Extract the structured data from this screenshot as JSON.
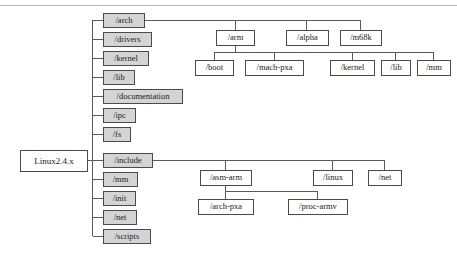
{
  "diagram": {
    "type": "tree",
    "colors": {
      "box_fill_highlight": "#d4d4d4",
      "box_fill_plain": "#ffffff",
      "box_stroke": "#4a4a4a",
      "edge_stroke": "#5a5a5a",
      "text": "#1a1a1a",
      "top_rule": "#b8b8b8",
      "background": "#ffffff"
    },
    "root": {
      "id": "root",
      "label": "Linux2.4.x",
      "filled": false,
      "x": 20,
      "y": 150,
      "w": 67,
      "h": 21
    },
    "level1": [
      {
        "id": "arch",
        "label": "/arch",
        "filled": true,
        "x": 103,
        "y": 13,
        "w": 41,
        "h": 14
      },
      {
        "id": "drivers",
        "label": "/drivers",
        "filled": true,
        "x": 103,
        "y": 32,
        "w": 48,
        "h": 14
      },
      {
        "id": "kernel",
        "label": "/kernel",
        "filled": true,
        "x": 103,
        "y": 51,
        "w": 45,
        "h": 14
      },
      {
        "id": "lib",
        "label": "/lib",
        "filled": true,
        "x": 103,
        "y": 70,
        "w": 31,
        "h": 14
      },
      {
        "id": "documentation",
        "label": "/documentation",
        "filled": true,
        "x": 103,
        "y": 89,
        "w": 79,
        "h": 14
      },
      {
        "id": "ipc",
        "label": "/ipc",
        "filled": true,
        "x": 103,
        "y": 108,
        "w": 32,
        "h": 14
      },
      {
        "id": "fs",
        "label": "/fs",
        "filled": true,
        "x": 103,
        "y": 127,
        "w": 27,
        "h": 14
      },
      {
        "id": "include",
        "label": "/include",
        "filled": true,
        "x": 103,
        "y": 153,
        "w": 49,
        "h": 14
      },
      {
        "id": "mm",
        "label": "/mm",
        "filled": true,
        "x": 103,
        "y": 172,
        "w": 34,
        "h": 14
      },
      {
        "id": "init",
        "label": "/init",
        "filled": true,
        "x": 103,
        "y": 191,
        "w": 32,
        "h": 14
      },
      {
        "id": "net",
        "label": "/net",
        "filled": true,
        "x": 103,
        "y": 210,
        "w": 33,
        "h": 14
      },
      {
        "id": "scripts",
        "label": "/scripts",
        "filled": true,
        "x": 103,
        "y": 229,
        "w": 47,
        "h": 14
      }
    ],
    "arch_children": [
      {
        "id": "arm",
        "label": "/arm",
        "filled": false,
        "x": 216,
        "y": 30,
        "w": 38,
        "h": 15
      },
      {
        "id": "alpha",
        "label": "/alpha",
        "filled": false,
        "x": 286,
        "y": 30,
        "w": 42,
        "h": 15
      },
      {
        "id": "m68k",
        "label": "/m68k",
        "filled": false,
        "x": 340,
        "y": 30,
        "w": 41,
        "h": 15
      }
    ],
    "arm_children": [
      {
        "id": "arm-boot",
        "label": "/boot",
        "filled": false,
        "x": 195,
        "y": 60,
        "w": 38,
        "h": 15
      },
      {
        "id": "arm-machpxa",
        "label": "/mach-pxa",
        "filled": false,
        "x": 245,
        "y": 60,
        "w": 58,
        "h": 15
      },
      {
        "id": "arm-kernel",
        "label": "/kernel",
        "filled": false,
        "x": 330,
        "y": 60,
        "w": 44,
        "h": 15
      },
      {
        "id": "arm-lib",
        "label": "/lib",
        "filled": false,
        "x": 381,
        "y": 60,
        "w": 29,
        "h": 15
      },
      {
        "id": "arm-mm",
        "label": "/mm",
        "filled": false,
        "x": 417,
        "y": 60,
        "w": 33,
        "h": 15
      }
    ],
    "include_children": [
      {
        "id": "asm-arm",
        "label": "/asm-arm",
        "filled": false,
        "x": 200,
        "y": 170,
        "w": 51,
        "h": 15
      },
      {
        "id": "linux",
        "label": "/linux",
        "filled": false,
        "x": 313,
        "y": 170,
        "w": 39,
        "h": 15
      },
      {
        "id": "inc-net",
        "label": "/net",
        "filled": false,
        "x": 368,
        "y": 170,
        "w": 33,
        "h": 15
      }
    ],
    "asm_arm_children": [
      {
        "id": "arch-pxa",
        "label": "/arch-pxa",
        "filled": false,
        "x": 198,
        "y": 199,
        "w": 55,
        "h": 15
      },
      {
        "id": "proc-armv",
        "label": "/proc-armv",
        "filled": false,
        "x": 288,
        "y": 199,
        "w": 59,
        "h": 15
      }
    ]
  }
}
